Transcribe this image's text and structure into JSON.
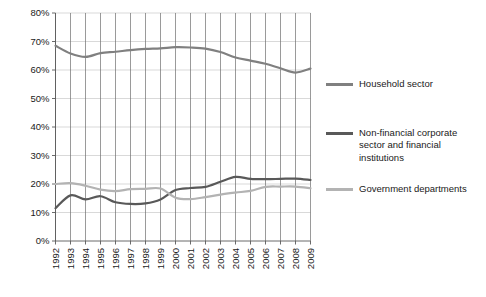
{
  "chart_data": {
    "type": "line",
    "title": "",
    "xlabel": "",
    "ylabel": "",
    "grid": true,
    "legend_position": "right",
    "ylim": [
      0,
      80
    ],
    "ytick_labels": [
      "80%",
      "70%",
      "60%",
      "50%",
      "40%",
      "30%",
      "20%",
      "10%",
      "0%"
    ],
    "ytick_values": [
      80,
      70,
      60,
      50,
      40,
      30,
      20,
      10,
      0
    ],
    "categories": [
      "1992",
      "1993",
      "1994",
      "1995",
      "1996",
      "1997",
      "1998",
      "1999",
      "2000",
      "2001",
      "2002",
      "2003",
      "2004",
      "2005",
      "2006",
      "2007",
      "2008",
      "2009"
    ],
    "x": [
      1992,
      1993,
      1994,
      1995,
      1996,
      1997,
      1998,
      1999,
      2000,
      2001,
      2002,
      2003,
      2004,
      2005,
      2006,
      2007,
      2008,
      2009
    ],
    "series": [
      {
        "name": "Household sector",
        "color": "#808080",
        "values": [
          68.5,
          65.8,
          64.6,
          65.9,
          66.4,
          67.0,
          67.4,
          67.6,
          68.0,
          67.9,
          67.5,
          66.3,
          64.4,
          63.3,
          62.2,
          60.6,
          59.1,
          60.5
        ]
      },
      {
        "name": "Non-financial corporate sector and financial institutions",
        "color": "#595959",
        "values": [
          11.5,
          16.0,
          14.6,
          15.7,
          13.6,
          13.0,
          13.2,
          14.6,
          17.9,
          18.6,
          19.0,
          20.8,
          22.5,
          21.8,
          21.7,
          21.8,
          21.9,
          21.4
        ]
      },
      {
        "name": "Government departments",
        "color": "#b3b3b3",
        "values": [
          20.0,
          20.3,
          19.4,
          18.0,
          17.5,
          18.2,
          18.3,
          18.4,
          15.2,
          14.7,
          15.4,
          16.3,
          17.0,
          17.6,
          19.0,
          19.1,
          19.1,
          18.5
        ]
      }
    ]
  },
  "legend": {
    "items": [
      {
        "label": "Household sector",
        "color": "#808080"
      },
      {
        "label": "Non-financial corporate\nsector and financial\ninstitutions",
        "color": "#595959"
      },
      {
        "label": "Government departments",
        "color": "#b3b3b3"
      }
    ]
  }
}
